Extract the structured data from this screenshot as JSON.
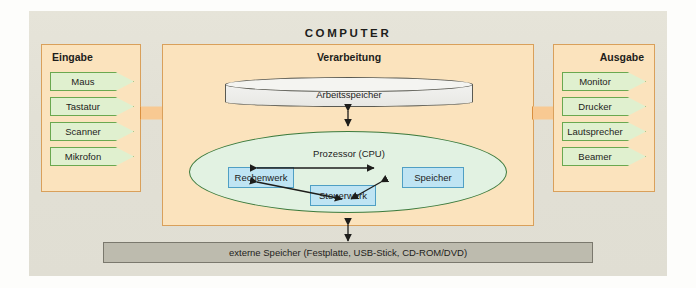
{
  "diagram": {
    "title": "COMPUTER",
    "input": {
      "title": "Eingabe",
      "items": [
        {
          "label": "Maus"
        },
        {
          "label": "Tastatur"
        },
        {
          "label": "Scanner"
        },
        {
          "label": "Mikrofon"
        }
      ]
    },
    "processing": {
      "title": "Verarbeitung",
      "memory": {
        "label": "Arbeitsspeicher"
      },
      "cpu": {
        "label": "Prozessor (CPU)",
        "units": [
          {
            "label": "Rechenwerk"
          },
          {
            "label": "Steuerwerk"
          },
          {
            "label": "Speicher"
          }
        ]
      }
    },
    "output": {
      "title": "Ausgabe",
      "items": [
        {
          "label": "Monitor"
        },
        {
          "label": "Drucker"
        },
        {
          "label": "Lautsprecher"
        },
        {
          "label": "Beamer"
        }
      ]
    },
    "external_storage": {
      "label": "externe Speicher (Festplatte, USB-Stick, CD-ROM/DVD)"
    },
    "flow_arrows": {
      "input_to_processing": "arrow-right",
      "processing_to_output": "arrow-right",
      "memory_cpu": "double-arrow-vertical",
      "processing_external": "double-arrow-vertical"
    },
    "colors": {
      "frame_background": "#e3e1d6",
      "panel_background": "#fbe3bd",
      "panel_border": "#d9a05b",
      "chevron_fill": "#e0f0cf",
      "chevron_border": "#6aa84f",
      "cpu_fill": "#e2f2e2",
      "cpu_border": "#3d7b3d",
      "cpu_box_fill": "#bfe4f3",
      "cpu_box_border": "#4f9fc4",
      "memory_fill": "#f2f2f0",
      "memory_border": "#5a5a52",
      "big_arrow_fill": "#f8c992",
      "big_arrow_border": "#d98f3f",
      "external_storage_fill": "#bdbbae",
      "text": "#1d1d1b"
    }
  }
}
